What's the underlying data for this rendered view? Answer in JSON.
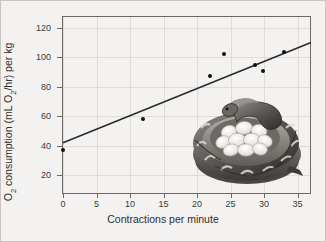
{
  "figure": {
    "background_color": "#f3f2f0",
    "border_color": "#c8c6c2"
  },
  "chart_data": {
    "type": "scatter",
    "title": "",
    "xlabel": "Contractions per minute",
    "ylabel": "O2 consumption (mL O2/hr) per kg",
    "ylabel_parts": {
      "before_first_sub": "O",
      "first_sub": "2",
      "middle": " consumption (mL O",
      "second_sub": "2",
      "after": "/hr) per kg"
    },
    "xlim": [
      0,
      37
    ],
    "ylim": [
      8,
      128
    ],
    "xticks": [
      0,
      5,
      10,
      15,
      20,
      25,
      30,
      35
    ],
    "xtick_labels": [
      "0",
      "5",
      "10",
      "15",
      "20",
      "25",
      "30",
      "35"
    ],
    "yticks": [
      20,
      40,
      60,
      80,
      100,
      120
    ],
    "ytick_labels": [
      "20",
      "40",
      "60",
      "80",
      "100",
      "120"
    ],
    "grid": true,
    "grid_color": "#dedcd8",
    "legend": "none",
    "marker_color": "#111111",
    "marker_size": 4,
    "points": [
      {
        "x": 0,
        "y": 37
      },
      {
        "x": 12,
        "y": 58.5
      },
      {
        "x": 22,
        "y": 87.5
      },
      {
        "x": 24,
        "y": 102
      },
      {
        "x": 28.6,
        "y": 95
      },
      {
        "x": 29.9,
        "y": 90.5
      },
      {
        "x": 33,
        "y": 103.5
      }
    ],
    "trendline": {
      "type": "linear-fit",
      "color": "#2b2b2b",
      "width": 1.6,
      "x_start": 0,
      "y_start": 42,
      "x_end": 37,
      "y_end": 110
    },
    "annotation_image": {
      "name": "python-coiled-around-eggs",
      "description": "Grayscale illustration of a python snake coiled around a clutch of white eggs",
      "x_data": 18.5,
      "y_data": 48
    }
  }
}
